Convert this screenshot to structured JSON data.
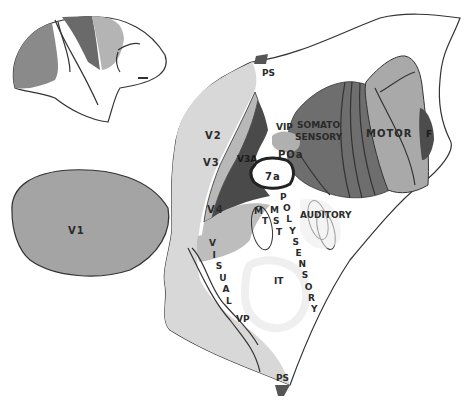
{
  "colors": {
    "background": "#ffffff",
    "outline": "#333333",
    "v1": "#a4a4a4",
    "v2": "#d8d8d8",
    "v3": "#b8b8b8",
    "v3a": "#4a4a4a",
    "v4": "#bdbdbd",
    "somatosensory": "#6e6e6e",
    "motor": "#a9a9a9",
    "frontal_dark": "#4c4c4c",
    "ps": "#555555",
    "poa": "#b0b0b0",
    "visual_band": "#e4e4e4",
    "pale_region": "#ececec"
  },
  "inset": {
    "name": "lateral brain view (inset)"
  },
  "labels": {
    "ps_top": "PS",
    "ps_bottom": "PS",
    "v1": "V1",
    "v2": "V2",
    "v3": "V3",
    "v3a": "V3A",
    "v4": "V4",
    "vip": "VIP",
    "poa": "POa",
    "area7a": "7a",
    "somato_line1": "SOMATO",
    "somato_line2": "SENSORY",
    "motor": "MOTOR",
    "frontal": "F",
    "mt_m": "M",
    "mt_t": "T",
    "mst_m": "M",
    "mst_s": "S",
    "mst_t": "T",
    "auditory": "AUDITORY",
    "it": "IT",
    "vp": "VP",
    "polysensory": [
      "P",
      "O",
      "L",
      "Y",
      "S",
      "E",
      "N",
      "S",
      "O",
      "R",
      "Y"
    ],
    "visual": [
      "V",
      "I",
      "S",
      "U",
      "A",
      "L"
    ]
  }
}
